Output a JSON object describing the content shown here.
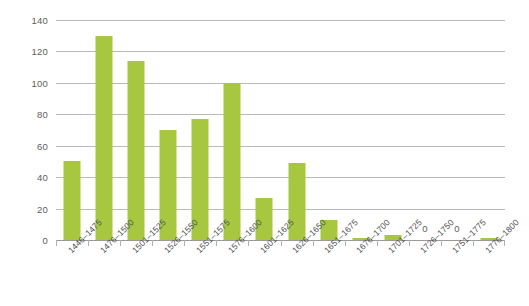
{
  "chart_data": {
    "type": "bar",
    "title": "",
    "subtitle": "",
    "xlabel": "",
    "ylabel": "",
    "categories": [
      "1446–1475",
      "1476–1500",
      "1501–1525",
      "1526–1550",
      "1551–1575",
      "1576–1600",
      "1601–1625",
      "1626–1650",
      "1651–1675",
      "1676–1700",
      "1701–1725",
      "1726–1750",
      "1751–1775",
      "1776–1800"
    ],
    "values": [
      50,
      130,
      114,
      70,
      77,
      100,
      27,
      49,
      13,
      1,
      3,
      0,
      0,
      1
    ],
    "point_labels": [
      "",
      "",
      "",
      "",
      "",
      "",
      "",
      "",
      "",
      "",
      "",
      "0",
      "0",
      ""
    ],
    "ylim": [
      0,
      140
    ],
    "ytick_values": [
      0,
      20,
      40,
      60,
      80,
      100,
      120,
      140
    ],
    "ytick_labels": [
      "0",
      "20",
      "40",
      "60",
      "80",
      "100",
      "120",
      "140"
    ],
    "grid": true,
    "legend": false,
    "legend_position": "none",
    "series": [
      {
        "name": "count",
        "color": "#a6c73f",
        "values": [
          50,
          130,
          114,
          70,
          77,
          100,
          27,
          49,
          13,
          1,
          3,
          0,
          0,
          1
        ]
      }
    ],
    "colors": {
      "bar": "#a6c73f",
      "gridline": "#b9b9b9",
      "axis": "#9a9a9a",
      "tick": "#b0b0b0",
      "text": "#555555",
      "background": "#ffffff"
    }
  }
}
